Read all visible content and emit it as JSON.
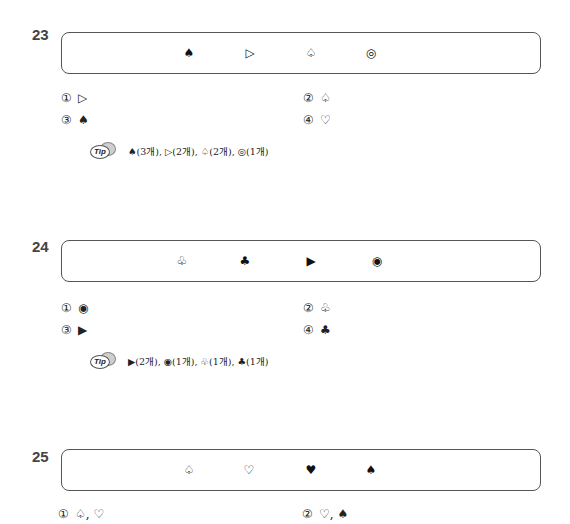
{
  "questions": [
    {
      "number": "23",
      "symbols": [
        "♠",
        "▷",
        "♤",
        "◎"
      ],
      "options": [
        {
          "num": "①",
          "text": "▷"
        },
        {
          "num": "②",
          "text": "♤"
        },
        {
          "num": "③",
          "text": "♠"
        },
        {
          "num": "④",
          "text": "♡"
        }
      ],
      "tip": {
        "label": "Tip",
        "text": "♠(3개), ▷(2개), ♤(2개), ◎(1개)"
      }
    },
    {
      "number": "24",
      "symbols": [
        "♧",
        "♣",
        "▶",
        "◉"
      ],
      "options": [
        {
          "num": "①",
          "text": "◉"
        },
        {
          "num": "②",
          "text": "♧"
        },
        {
          "num": "③",
          "text": "▶"
        },
        {
          "num": "④",
          "text": "♣"
        }
      ],
      "tip": {
        "label": "Tip",
        "text": "▶(2개), ◉(1개), ♧(1개), ♣(1개)"
      }
    },
    {
      "number": "25",
      "symbols": [
        "♤",
        "♡",
        "♥",
        "♠"
      ],
      "options": [
        {
          "num": "①",
          "text": "♤, ♡"
        },
        {
          "num": "②",
          "text": "♡, ♠"
        }
      ]
    }
  ]
}
